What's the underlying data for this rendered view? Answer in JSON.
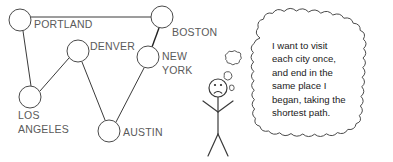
{
  "diagram": {
    "graph": {
      "nodes": [
        {
          "id": "portland",
          "label": "PORTLAND",
          "cx": 20,
          "cy": 20,
          "r": 11,
          "label_x": 34,
          "label_y": 28
        },
        {
          "id": "boston",
          "label": "BOSTON",
          "cx": 162,
          "cy": 17,
          "r": 11,
          "label_x": 172,
          "label_y": 36
        },
        {
          "id": "denver",
          "label": "DENVER",
          "cx": 78,
          "cy": 51,
          "r": 11,
          "label_x": 90,
          "label_y": 50
        },
        {
          "id": "new-york",
          "label": "NEW",
          "cx": 148,
          "cy": 57,
          "r": 11,
          "label_x": 162,
          "label_y": 60
        },
        {
          "id": "new-york-2",
          "label": "YORK",
          "cx": 148,
          "cy": 57,
          "r": 11,
          "label_x": 162,
          "label_y": 74
        },
        {
          "id": "los-angeles",
          "label": "LOS",
          "cx": 30,
          "cy": 97,
          "r": 11,
          "label_x": 18,
          "label_y": 119
        },
        {
          "id": "los-angeles-2",
          "label": "ANGELES",
          "cx": 30,
          "cy": 97,
          "r": 11,
          "label_x": 18,
          "label_y": 133
        },
        {
          "id": "austin",
          "label": "AUSTIN",
          "cx": 109,
          "cy": 131,
          "r": 11,
          "label_x": 123,
          "label_y": 136
        }
      ],
      "edges": [
        {
          "id": "portland-boston",
          "from": "portland",
          "to": "boston",
          "x1": 31,
          "y1": 17,
          "x2": 151,
          "y2": 17,
          "weight": "normal"
        },
        {
          "id": "portland-la",
          "from": "portland",
          "to": "los-angeles",
          "x1": 23,
          "y1": 31,
          "x2": 31,
          "y2": 86,
          "weight": "normal"
        },
        {
          "id": "la-denver",
          "from": "los-angeles",
          "to": "denver",
          "x1": 40,
          "y1": 91,
          "x2": 69,
          "y2": 58,
          "weight": "normal"
        },
        {
          "id": "denver-austin",
          "from": "denver",
          "to": "austin",
          "x1": 82,
          "y1": 62,
          "x2": 105,
          "y2": 120,
          "weight": "normal"
        },
        {
          "id": "austin-new-york",
          "from": "austin",
          "to": "new-york",
          "x1": 116,
          "y1": 122,
          "x2": 144,
          "y2": 68,
          "weight": "normal"
        },
        {
          "id": "new-york-boston",
          "from": "new-york",
          "to": "boston",
          "x1": 152,
          "y1": 47,
          "x2": 159,
          "y2": 28,
          "weight": "strong"
        }
      ]
    },
    "figure": {
      "name": "stick-figure-person",
      "expression": "sad",
      "head_cx": 218,
      "head_cy": 88,
      "head_r": 9
    },
    "thought": {
      "lines": [
        "I want to visit",
        "each city once,",
        "and end in the",
        "same place I",
        "began, taking the",
        "shortest path."
      ],
      "text_x": 272,
      "text_start_y": 49,
      "line_height": 13.4
    },
    "puffs": [
      {
        "id": "puff-large",
        "cx": 233,
        "cy": 60,
        "rx": 8,
        "ry": 7
      },
      {
        "id": "puff-mid",
        "cx": 228,
        "cy": 76,
        "rx": 4.5,
        "ry": 4
      },
      {
        "id": "puff-small",
        "cx": 231,
        "cy": 88,
        "rx": 3.2,
        "ry": 3
      }
    ],
    "colors": {
      "ink": "#3a3a3a",
      "label": "#5a5a5a",
      "text": "#1a1a1a",
      "background": "#ffffff"
    }
  }
}
